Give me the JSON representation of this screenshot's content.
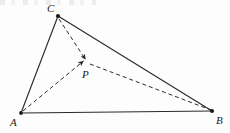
{
  "figure": {
    "background_color": "#fdfdfd",
    "stroke_color": "#2b2b2b",
    "label_color": "#1b1b1b",
    "canvas": {
      "width": 230,
      "height": 133
    },
    "vertices": [
      {
        "id": "C",
        "label": "C",
        "x": 58,
        "y": 16,
        "label_x": 47,
        "label_y": 12
      },
      {
        "id": "A",
        "label": "A",
        "x": 21,
        "y": 113,
        "label_x": 10,
        "label_y": 126
      },
      {
        "id": "B",
        "label": "B",
        "x": 212,
        "y": 111,
        "label_x": 216,
        "label_y": 124
      },
      {
        "id": "P",
        "label": "P",
        "x": 86,
        "y": 63,
        "label_x": 82,
        "label_y": 78
      }
    ],
    "edges": [
      {
        "id": "AC",
        "from": "A",
        "to": "C",
        "style": "solid",
        "arrow": false
      },
      {
        "id": "CB",
        "from": "C",
        "to": "B",
        "style": "solid",
        "arrow": false
      },
      {
        "id": "AB",
        "from": "A",
        "to": "B",
        "style": "solid",
        "arrow": false
      },
      {
        "id": "CP",
        "from": "C",
        "to": "P",
        "style": "dashed",
        "arrow": true
      },
      {
        "id": "AP",
        "from": "A",
        "to": "P",
        "style": "dashed",
        "arrow": true
      },
      {
        "id": "PB",
        "from": "P",
        "to": "B",
        "style": "dashed",
        "arrow": false
      }
    ],
    "notes": {
      "dash_pattern": "4 3",
      "point_marker": "filled-dot"
    }
  }
}
